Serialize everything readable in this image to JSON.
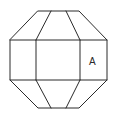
{
  "diagram": {
    "type": "octagon-net",
    "stroke_color": "#2a2a2a",
    "background": "#ffffff",
    "label": "A",
    "label_face": "right-middle-rectangle"
  }
}
